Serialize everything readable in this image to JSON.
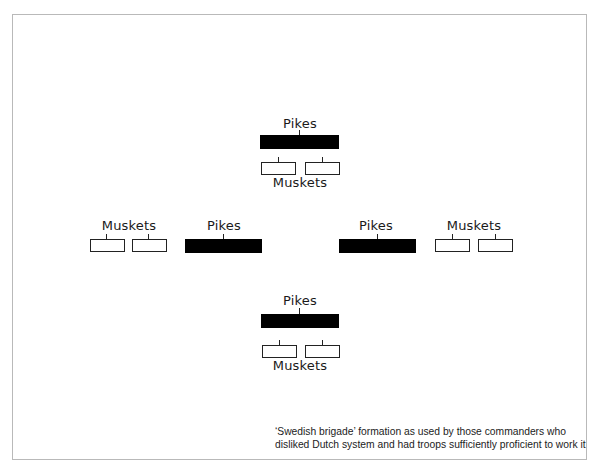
{
  "diagram": {
    "groups": {
      "top": {
        "pikes_label": "Pikes",
        "muskets_label": "Muskets"
      },
      "left": {
        "pikes_label": "Pikes",
        "muskets_label": "Muskets"
      },
      "right": {
        "pikes_label": "Pikes",
        "muskets_label": "Muskets"
      },
      "bottom": {
        "pikes_label": "Pikes",
        "muskets_label": "Muskets"
      }
    },
    "caption": {
      "line1": "‘Swedish brigade’ formation as used by those commanders who",
      "line2": "disliked Dutch system and had troops sufficiently proficient to work it"
    },
    "legend": {
      "pikes_fill": "#000000",
      "muskets_fill": "#ffffff"
    }
  }
}
